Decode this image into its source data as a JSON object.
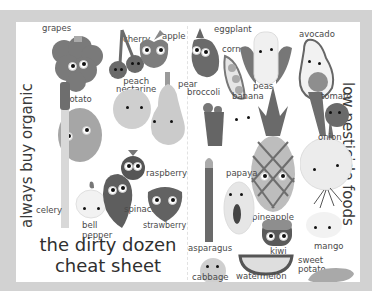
{
  "poster": {
    "title_line1": "the dirty dozen",
    "title_line2": "cheat sheet",
    "left_side_heading": "always buy organic",
    "right_side_heading": "low pesticide foods"
  },
  "dirty_dozen": [
    {
      "name": "grapes",
      "label": "grapes"
    },
    {
      "name": "cherry",
      "label": "cherry"
    },
    {
      "name": "apple",
      "label": "apple"
    },
    {
      "name": "peach-nectarine",
      "label": "peach\nnectarine",
      "label_line1": "peach",
      "label_line2": "nectarine"
    },
    {
      "name": "pear",
      "label": "pear"
    },
    {
      "name": "potato",
      "label": "potato"
    },
    {
      "name": "raspberry",
      "label": "raspberry"
    },
    {
      "name": "celery",
      "label": "celery"
    },
    {
      "name": "bell-pepper",
      "label": "bell pepper",
      "label_line1": "bell",
      "label_line2": "pepper"
    },
    {
      "name": "spinach",
      "label": "spinach"
    },
    {
      "name": "strawberry",
      "label": "strawberry"
    }
  ],
  "clean_foods": [
    {
      "name": "eggplant",
      "label": "eggplant"
    },
    {
      "name": "corn",
      "label": "corn"
    },
    {
      "name": "avocado",
      "label": "avocado"
    },
    {
      "name": "peas",
      "label": "peas"
    },
    {
      "name": "broccoli",
      "label": "broccoli"
    },
    {
      "name": "banana",
      "label": "banana"
    },
    {
      "name": "tomato",
      "label": "tomato"
    },
    {
      "name": "onion",
      "label": "onion"
    },
    {
      "name": "papaya",
      "label": "papaya"
    },
    {
      "name": "pineapple",
      "label": "pineapple"
    },
    {
      "name": "asparagus",
      "label": "asparagus"
    },
    {
      "name": "kiwi",
      "label": "kiwi"
    },
    {
      "name": "mango",
      "label": "mango"
    },
    {
      "name": "sweet-potato",
      "label": "sweet potato",
      "label_line1": "sweet",
      "label_line2": "potato"
    },
    {
      "name": "cabbage",
      "label": "cabbage"
    },
    {
      "name": "watermelon",
      "label": "watermelon"
    }
  ],
  "colors": {
    "frame": "#d2d2d2",
    "card": "#ffffff",
    "text": "#3a3a3a",
    "dark_fill": "#6a6a6a",
    "mid_fill": "#9a9a9a",
    "light_fill": "#cfcfcf"
  }
}
